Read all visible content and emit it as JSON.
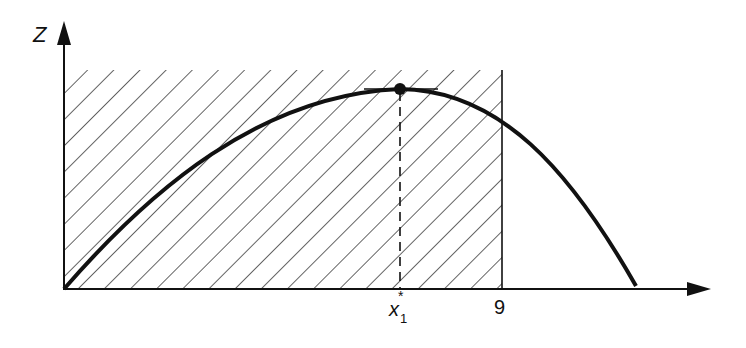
{
  "diagram": {
    "y_axis_label": "Z",
    "x_marker_label": "x",
    "x_marker_subscript": "1",
    "x_marker_superscript": "*",
    "bound_label": "9",
    "colors": {
      "ink": "#111111",
      "background": "#ffffff"
    }
  }
}
